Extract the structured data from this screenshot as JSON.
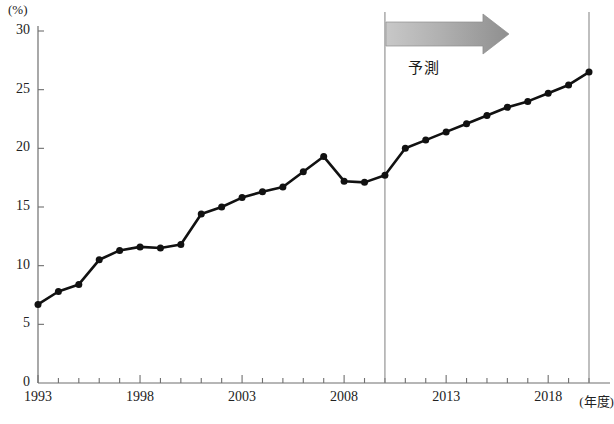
{
  "chart_data": {
    "type": "line",
    "title": "",
    "subtitle": "",
    "xlabel": "(年度)",
    "ylabel": "(%)",
    "xlim": [
      1993,
      2020
    ],
    "ylim": [
      0,
      30
    ],
    "grid": false,
    "legend": "none",
    "x": [
      1993,
      1994,
      1995,
      1996,
      1997,
      1998,
      1999,
      2000,
      2001,
      2002,
      2003,
      2004,
      2005,
      2006,
      2007,
      2008,
      2009,
      2010,
      2011,
      2012,
      2013,
      2014,
      2015,
      2016,
      2017,
      2018,
      2019,
      2020
    ],
    "values": [
      6.7,
      7.8,
      8.4,
      10.5,
      11.3,
      11.6,
      11.5,
      11.8,
      14.4,
      15.0,
      15.8,
      16.3,
      16.7,
      18.0,
      19.3,
      17.2,
      17.1,
      17.7,
      20.0,
      20.7,
      21.4,
      22.1,
      22.8,
      23.5,
      24.0,
      24.7,
      25.4,
      26.5
    ],
    "series": [
      {
        "name": "比率",
        "values": [
          6.7,
          7.8,
          8.4,
          10.5,
          11.3,
          11.6,
          11.5,
          11.8,
          14.4,
          15.0,
          15.8,
          16.3,
          16.7,
          18.0,
          19.3,
          17.2,
          17.1,
          17.7,
          20.0,
          20.7,
          21.4,
          22.1,
          22.8,
          23.5,
          24.0,
          24.7,
          25.4,
          26.5
        ],
        "color": "#111111",
        "marker": "circle"
      }
    ],
    "ytick_labels": [
      "0",
      "5",
      "10",
      "15",
      "20",
      "25",
      "30"
    ],
    "ytick_values": [
      0,
      5,
      10,
      15,
      20,
      25,
      30
    ],
    "xtick_labels": [
      "1993",
      "1998",
      "2003",
      "2008",
      "2013",
      "2018"
    ],
    "xtick_values": [
      1993,
      1998,
      2003,
      2008,
      2013,
      2018
    ],
    "xtick_minor_values": [
      1994,
      1995,
      1996,
      1997,
      1999,
      2000,
      2001,
      2002,
      2004,
      2005,
      2006,
      2007,
      2009,
      2010,
      2011,
      2012,
      2014,
      2015,
      2016,
      2017,
      2019,
      2020
    ],
    "annotations": [
      {
        "name": "forecast-label",
        "text": "予測",
        "x": 2012,
        "y": 27.0
      }
    ],
    "reference_lines": [
      {
        "name": "forecast-start-line",
        "x": 2010,
        "color": "#8a8a8a"
      },
      {
        "name": "chart-right-edge-line",
        "x": 2020,
        "color": "#8a8a8a"
      }
    ],
    "forecast_arrow": {
      "from_x": 2010,
      "to_x": 2015,
      "color": "#9d9d9d"
    },
    "colors": {
      "line": "#111111",
      "marker": "#111111",
      "axis": "#6f6f6f",
      "reference_line": "#8a8a8a",
      "arrow": "#a0a0a0",
      "background": "#ffffff"
    }
  }
}
